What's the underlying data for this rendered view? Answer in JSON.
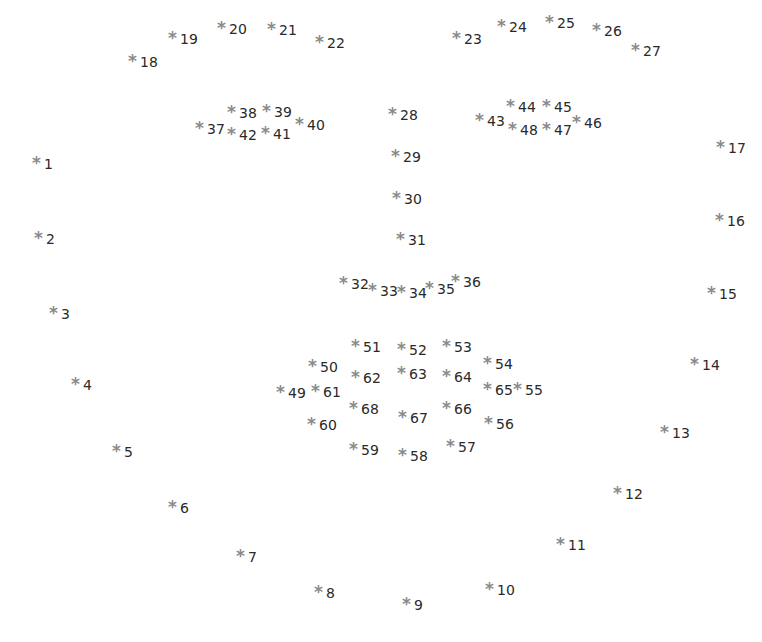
{
  "diagram": {
    "title": "",
    "marker_symbol": "*",
    "marker_color": "#8a8a8a",
    "label_color": "#2a2a2a",
    "landmarks": [
      {
        "id": "1",
        "x": 38,
        "y": 163
      },
      {
        "id": "2",
        "x": 40,
        "y": 238
      },
      {
        "id": "3",
        "x": 55,
        "y": 313
      },
      {
        "id": "4",
        "x": 77,
        "y": 384
      },
      {
        "id": "5",
        "x": 118,
        "y": 451
      },
      {
        "id": "6",
        "x": 174,
        "y": 507
      },
      {
        "id": "7",
        "x": 242,
        "y": 556
      },
      {
        "id": "8",
        "x": 320,
        "y": 592
      },
      {
        "id": "9",
        "x": 408,
        "y": 604
      },
      {
        "id": "10",
        "x": 491,
        "y": 589
      },
      {
        "id": "11",
        "x": 562,
        "y": 544
      },
      {
        "id": "12",
        "x": 619,
        "y": 493
      },
      {
        "id": "13",
        "x": 666,
        "y": 432
      },
      {
        "id": "14",
        "x": 696,
        "y": 364
      },
      {
        "id": "15",
        "x": 713,
        "y": 293
      },
      {
        "id": "16",
        "x": 721,
        "y": 220
      },
      {
        "id": "17",
        "x": 722,
        "y": 147
      },
      {
        "id": "18",
        "x": 134,
        "y": 61
      },
      {
        "id": "19",
        "x": 174,
        "y": 38
      },
      {
        "id": "20",
        "x": 223,
        "y": 28
      },
      {
        "id": "21",
        "x": 273,
        "y": 29
      },
      {
        "id": "22",
        "x": 321,
        "y": 42
      },
      {
        "id": "23",
        "x": 458,
        "y": 38
      },
      {
        "id": "24",
        "x": 503,
        "y": 26
      },
      {
        "id": "25",
        "x": 551,
        "y": 22
      },
      {
        "id": "26",
        "x": 598,
        "y": 30
      },
      {
        "id": "27",
        "x": 637,
        "y": 50
      },
      {
        "id": "28",
        "x": 394,
        "y": 114
      },
      {
        "id": "29",
        "x": 397,
        "y": 156
      },
      {
        "id": "30",
        "x": 398,
        "y": 198
      },
      {
        "id": "31",
        "x": 402,
        "y": 239
      },
      {
        "id": "32",
        "x": 345,
        "y": 283
      },
      {
        "id": "33",
        "x": 374,
        "y": 290
      },
      {
        "id": "34",
        "x": 403,
        "y": 292
      },
      {
        "id": "35",
        "x": 431,
        "y": 288
      },
      {
        "id": "36",
        "x": 457,
        "y": 281
      },
      {
        "id": "37",
        "x": 201,
        "y": 128
      },
      {
        "id": "38",
        "x": 233,
        "y": 112
      },
      {
        "id": "39",
        "x": 268,
        "y": 111
      },
      {
        "id": "40",
        "x": 301,
        "y": 124
      },
      {
        "id": "41",
        "x": 267,
        "y": 133
      },
      {
        "id": "42",
        "x": 233,
        "y": 134
      },
      {
        "id": "43",
        "x": 481,
        "y": 120
      },
      {
        "id": "44",
        "x": 512,
        "y": 106
      },
      {
        "id": "45",
        "x": 548,
        "y": 106
      },
      {
        "id": "46",
        "x": 578,
        "y": 122
      },
      {
        "id": "47",
        "x": 548,
        "y": 129
      },
      {
        "id": "48",
        "x": 514,
        "y": 129
      },
      {
        "id": "49",
        "x": 282,
        "y": 392
      },
      {
        "id": "50",
        "x": 314,
        "y": 366
      },
      {
        "id": "51",
        "x": 357,
        "y": 346
      },
      {
        "id": "52",
        "x": 403,
        "y": 349
      },
      {
        "id": "53",
        "x": 448,
        "y": 346
      },
      {
        "id": "54",
        "x": 489,
        "y": 363
      },
      {
        "id": "55",
        "x": 519,
        "y": 389
      },
      {
        "id": "56",
        "x": 490,
        "y": 423
      },
      {
        "id": "57",
        "x": 452,
        "y": 446
      },
      {
        "id": "58",
        "x": 404,
        "y": 455
      },
      {
        "id": "59",
        "x": 355,
        "y": 449
      },
      {
        "id": "60",
        "x": 313,
        "y": 424
      },
      {
        "id": "61",
        "x": 317,
        "y": 391
      },
      {
        "id": "62",
        "x": 357,
        "y": 377
      },
      {
        "id": "63",
        "x": 403,
        "y": 373
      },
      {
        "id": "64",
        "x": 448,
        "y": 376
      },
      {
        "id": "65",
        "x": 489,
        "y": 389
      },
      {
        "id": "66",
        "x": 448,
        "y": 408
      },
      {
        "id": "67",
        "x": 404,
        "y": 417
      },
      {
        "id": "68",
        "x": 355,
        "y": 408
      }
    ]
  }
}
